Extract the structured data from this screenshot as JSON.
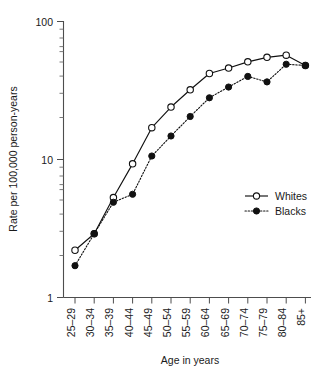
{
  "chart_data": {
    "type": "line",
    "title": "",
    "xlabel": "Age in years",
    "ylabel": "Rate per 100,000 person-years",
    "y_scale": "log",
    "ylim": [
      1,
      100
    ],
    "y_tick_labels": [
      "1",
      "10",
      "100"
    ],
    "y_tick_values": [
      1,
      10,
      100
    ],
    "grid": false,
    "legend_position": "right-middle",
    "categories": [
      "25–29",
      "30–34",
      "35–39",
      "40–44",
      "45–49",
      "50–54",
      "55–59",
      "60–64",
      "65–69",
      "70–74",
      "75–79",
      "80–84",
      "85+"
    ],
    "series": [
      {
        "name": "Whites",
        "marker": "open-circle",
        "line_style": "solid",
        "color": "#111111",
        "values": [
          2.2,
          2.9,
          5.3,
          9.3,
          17.0,
          24.0,
          32.0,
          42.0,
          46.0,
          51.0,
          55.0,
          57.0,
          48.0
        ]
      },
      {
        "name": "Blacks",
        "marker": "filled-circle",
        "line_style": "dotted",
        "color": "#111111",
        "values": [
          1.7,
          2.9,
          4.9,
          5.6,
          10.6,
          14.8,
          20.5,
          28.0,
          33.5,
          40.0,
          36.5,
          49.0,
          48.0
        ]
      }
    ]
  },
  "axes": {
    "x_title": "Age in years",
    "y_title": "Rate per 100,000 person-years",
    "x_tick_labels": [
      "25–29",
      "30–34",
      "35–39",
      "40–44",
      "45–49",
      "50–54",
      "55–59",
      "60–64",
      "65–69",
      "70–74",
      "75–79",
      "80–84",
      "85+"
    ],
    "y_tick_labels": {
      "top": "100",
      "middle": "10",
      "bottom": "1"
    }
  },
  "legend": {
    "entries": [
      {
        "label": "Whites",
        "marker": "open-circle",
        "line_style": "solid"
      },
      {
        "label": "Blacks",
        "marker": "filled-circle",
        "line_style": "dotted"
      }
    ]
  }
}
